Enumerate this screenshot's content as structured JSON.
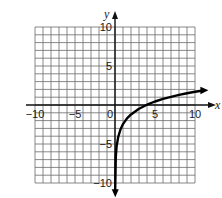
{
  "chart_data": {
    "type": "line",
    "title": "",
    "xlabel": "x",
    "ylabel": "y",
    "xlim": [
      -10,
      10
    ],
    "ylim": [
      -10,
      10
    ],
    "grid": true,
    "grid_step": 1,
    "x_ticks": [
      -10,
      -5,
      0,
      5,
      10
    ],
    "y_ticks": [
      -10,
      -5,
      5,
      10
    ],
    "x_tick_labels": [
      "−10",
      "−5",
      "0",
      "5",
      "10"
    ],
    "y_tick_labels": [
      "−10",
      "−5",
      "5",
      "10"
    ],
    "series": [
      {
        "name": "curve",
        "description": "logarithmic curve with vertical asymptote at x = 0, crossing the x-axis near x = 3, arrow at both ends",
        "x": [
          0.03,
          0.1,
          0.2,
          0.4,
          0.7,
          1,
          1.5,
          2,
          3,
          4,
          5,
          6,
          7,
          8,
          9,
          10,
          10.8
        ],
        "y": [
          -10.8,
          -6.6,
          -5.3,
          -4.1,
          -3.1,
          -2.45,
          -1.72,
          -1.2,
          -0.47,
          0.04,
          0.45,
          0.78,
          1.05,
          1.29,
          1.5,
          1.69,
          1.83
        ]
      }
    ],
    "legend": null
  }
}
